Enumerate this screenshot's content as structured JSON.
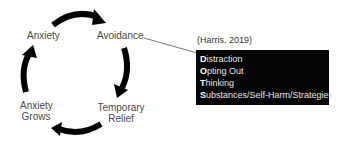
{
  "diagram": {
    "cycle_nodes": [
      {
        "id": "anxiety",
        "label": "Anxiety"
      },
      {
        "id": "avoidance",
        "label": "Avoidance"
      },
      {
        "id": "temporary-relief",
        "label_line1": "Temporary",
        "label_line2": "Relief"
      },
      {
        "id": "anxiety-grows",
        "label_line1": "Anxiety",
        "label_line2": "Grows"
      }
    ],
    "edges": [
      {
        "from": "anxiety",
        "to": "avoidance",
        "style": "curved-arrow"
      },
      {
        "from": "avoidance",
        "to": "temporary-relief",
        "style": "curved-arrow"
      },
      {
        "from": "temporary-relief",
        "to": "anxiety-grows",
        "style": "curved-arrow"
      },
      {
        "from": "anxiety-grows",
        "to": "anxiety",
        "style": "curved-arrow"
      },
      {
        "from": "avoidance",
        "to": "dots-box",
        "style": "line"
      }
    ],
    "citation": "(Harris, 2019)",
    "dots_box": {
      "items": [
        {
          "initial": "D",
          "rest": "istraction"
        },
        {
          "initial": "O",
          "rest": "pting Out"
        },
        {
          "initial": "T",
          "rest": "hinking"
        },
        {
          "initial": "S",
          "rest": "ubstances/Self-Harm/Strategies"
        }
      ]
    },
    "colors": {
      "arrow": "#000000",
      "label_text": "#4a4a4a",
      "box_background": "#050505",
      "box_text": "#e6e6e6"
    }
  }
}
